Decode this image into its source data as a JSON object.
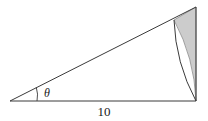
{
  "figure": {
    "background_color": "#ffffff",
    "stroke_color": "#3a3a3a",
    "shade_fill_color": "#cccccc",
    "shade_stroke_color": "#8c8c8c",
    "labels": {
      "angle": "θ",
      "base_length": "10"
    },
    "geometry": {
      "left_vertex": [
        10,
        101
      ],
      "bottom_right_vertex": [
        196,
        101
      ],
      "top_right_vertex": [
        196,
        7
      ],
      "arc_start_on_hypotenuse": [
        174,
        20
      ],
      "arc_end_at_base": [
        196,
        101
      ],
      "arc_radius": 186,
      "angle_arc_radius": 27,
      "base_line_y": 101,
      "vertical_leg_x": 196
    },
    "label_positions": {
      "angle": [
        47,
        97
      ],
      "base_length": [
        104,
        116
      ]
    }
  }
}
